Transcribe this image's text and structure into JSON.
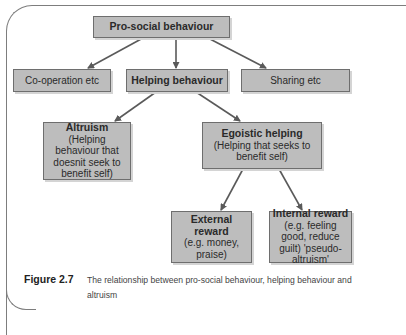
{
  "diagram": {
    "nodes": {
      "prosocial": {
        "title": "Pro-social behaviour"
      },
      "cooperation": {
        "title": "Co-operation etc"
      },
      "helping": {
        "title": "Helping behaviour"
      },
      "sharing": {
        "title": "Sharing etc"
      },
      "altruism": {
        "title": "Altruism",
        "sub": "(Helping behaviour that doesnit seek to benefit self)"
      },
      "egoistic": {
        "title": "Egoistic helping",
        "sub": "(Helping that seeks to benefit self)"
      },
      "external": {
        "title": "External reward",
        "sub": "(e.g. money, praise)"
      },
      "internal": {
        "title": "Internal reward",
        "sub": "(e.g. feeling good, reduce guilt) 'pseudo-altruism'"
      }
    },
    "edges": [
      [
        "prosocial",
        "cooperation"
      ],
      [
        "prosocial",
        "helping"
      ],
      [
        "prosocial",
        "sharing"
      ],
      [
        "helping",
        "altruism"
      ],
      [
        "helping",
        "egoistic"
      ],
      [
        "egoistic",
        "external"
      ],
      [
        "egoistic",
        "internal"
      ]
    ],
    "colors": {
      "box_fill": "#bdbdbd",
      "box_border": "#6e6e6e",
      "arrow": "#5a5a5a",
      "frame": "#7d7d7d"
    }
  },
  "caption": {
    "label": "Figure 2.7",
    "text": "The relationship between pro-social behaviour, helping behaviour and altruism"
  }
}
